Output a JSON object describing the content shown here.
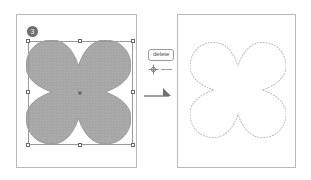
{
  "figure": {
    "step_number": "3"
  },
  "panels": {
    "left": {
      "name": "before-artboard",
      "shape_label": "quatrefoil-filled",
      "fill_color": "#a8a8a8",
      "stroke_color": "#8f8f8f",
      "selected": true,
      "selection": {
        "handle_fill": "#ffffff",
        "handle_border": "#6a6a6a",
        "box_border": "#9a9a9a",
        "handle_count": 8,
        "center_point_color": "#5d5d5d"
      }
    },
    "right": {
      "name": "after-artboard",
      "shape_label": "quatrefoil-outline",
      "fill_color": "none",
      "stroke_color": "#bdbdbd",
      "stroke_style": "dotted",
      "selected": true
    }
  },
  "callout": {
    "key_label": "delete",
    "cursor_icon": "crosshair-cursor-icon",
    "arrow_icon": "arrow-right-icon",
    "arrow_color": "#6f6f6f"
  },
  "colors": {
    "panel_border": "#b9b9b9",
    "badge_bg": "#6d6d6d",
    "badge_text": "#ffffff",
    "background": "#ffffff"
  }
}
